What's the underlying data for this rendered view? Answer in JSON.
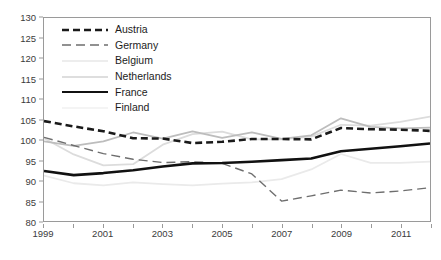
{
  "chart_data": {
    "type": "line",
    "title": "",
    "subtitle": "",
    "xlabel": "",
    "ylabel": "",
    "xlim": [
      1999,
      2012
    ],
    "ylim": [
      80,
      130
    ],
    "y_ticks": [
      80,
      85,
      90,
      95,
      100,
      105,
      110,
      115,
      120,
      125,
      130
    ],
    "x_ticks": [
      1999,
      2000,
      2001,
      2002,
      2003,
      2004,
      2005,
      2006,
      2007,
      2008,
      2009,
      2010,
      2011,
      2012
    ],
    "x_tick_labels": [
      "1999",
      "",
      "2001",
      "",
      "2003",
      "",
      "2005",
      "",
      "2007",
      "",
      "2009",
      "",
      "2011",
      ""
    ],
    "grid": false,
    "legend_position": "inside-top-left",
    "x": [
      1999,
      2000,
      2001,
      2002,
      2003,
      2004,
      2005,
      2006,
      2007,
      2008,
      2009,
      2010,
      2011,
      2012
    ],
    "series": [
      {
        "name": "Austria",
        "style": "dashed",
        "color": "#1a1a1a",
        "width": 2.6,
        "dash": "7,4",
        "values": [
          104.6,
          103.3,
          102.1,
          100.4,
          100.3,
          99.2,
          99.5,
          100.2,
          100.2,
          100.1,
          102.9,
          102.6,
          102.5,
          102.2
        ]
      },
      {
        "name": "Germany",
        "style": "dashed",
        "color": "#6e6e6e",
        "width": 1.4,
        "dash": "9,5",
        "values": [
          100.6,
          98.6,
          96.6,
          95.2,
          94.4,
          94.6,
          94.2,
          91.6,
          84.9,
          86.2,
          87.6,
          86.9,
          87.4,
          88.2
        ]
      },
      {
        "name": "Belgium",
        "style": "solid",
        "color": "#dcdcdc",
        "width": 1.8,
        "dash": "",
        "values": [
          100.4,
          96.4,
          93.7,
          94.0,
          98.8,
          101.4,
          102.0,
          100.1,
          100.1,
          100.8,
          103.7,
          103.5,
          104.4,
          105.7
        ]
      },
      {
        "name": "Netherlands",
        "style": "solid",
        "color": "#bdbdbd",
        "width": 1.8,
        "dash": "",
        "values": [
          99.6,
          98.5,
          99.6,
          101.8,
          100.3,
          102.1,
          100.5,
          101.8,
          100.2,
          101.1,
          105.3,
          103.2,
          102.8,
          103.0
        ]
      },
      {
        "name": "France",
        "style": "solid",
        "color": "#111111",
        "width": 2.6,
        "dash": "",
        "values": [
          92.3,
          91.3,
          91.8,
          92.5,
          93.4,
          94.2,
          94.3,
          94.6,
          95.0,
          95.4,
          97.2,
          97.8,
          98.4,
          99.1
        ]
      },
      {
        "name": "Finland",
        "style": "solid",
        "color": "#eaeaea",
        "width": 1.8,
        "dash": "",
        "values": [
          91.2,
          89.3,
          88.8,
          89.5,
          89.1,
          88.8,
          89.2,
          89.5,
          90.3,
          92.7,
          96.5,
          94.3,
          94.3,
          94.6
        ]
      }
    ]
  }
}
